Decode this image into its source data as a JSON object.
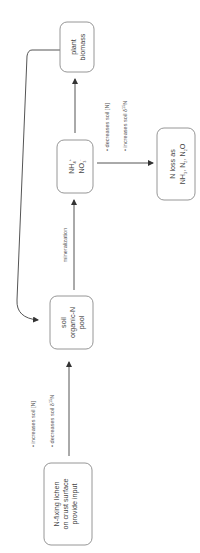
{
  "diagram": {
    "orientation": "rotated-90-ccw",
    "colors": {
      "background": "#ffffff",
      "box_stroke": "#8a8a8a",
      "arrow": "#555555",
      "text": "#444444"
    },
    "nodes": {
      "lichen": {
        "lines": [
          "N-fixing lichen",
          "on crust surface",
          "provide input"
        ]
      },
      "soil_pool": {
        "lines": [
          "soil",
          "organic-N",
          "pool"
        ]
      },
      "inorganic": {
        "line1": "NH",
        "line1_sub": "4",
        "line1_sup": "+",
        "line2": "NO",
        "line2_sub": "3",
        "line2_sup": "-"
      },
      "plant": {
        "lines": [
          "plant",
          "biomass"
        ]
      },
      "loss": {
        "line1": "N loss as",
        "line2_a": "NH",
        "line2_a_sub": "3",
        "line2_b": ", N",
        "line2_b_sub": "2",
        "line2_c": ", N",
        "line2_c_sub": "2",
        "line2_d": "O"
      }
    },
    "edges": {
      "lichen_to_soil": {
        "bullets": [
          {
            "text": "increases soil [N]"
          },
          {
            "text_pre": "decreases soil δ",
            "sup": "15",
            "text_post": "N"
          }
        ]
      },
      "soil_to_inorganic": {
        "label": "mineralization"
      },
      "inorganic_to_loss": {
        "bullets": [
          {
            "text": "decreases soil [N]"
          },
          {
            "text_pre": "increases soil δ",
            "sup": "15",
            "text_post": "N"
          }
        ]
      },
      "inorganic_to_plant": {},
      "plant_to_soil": {}
    },
    "bullet_char": "•"
  }
}
